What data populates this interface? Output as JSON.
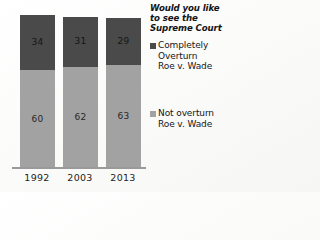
{
  "chart_data": {
    "type": "bar",
    "subtype": "stacked-column",
    "title": "Would you like to see the Supreme Court",
    "title_lines": [
      "Would you like",
      "to see the",
      "Supreme Court"
    ],
    "xlabel": "",
    "ylabel": "",
    "ylim": [
      0,
      100
    ],
    "grid": false,
    "legend_position": "right",
    "categories": [
      "1992",
      "2003",
      "2013"
    ],
    "series": [
      {
        "name": "Completely Overturn Roe v. Wade",
        "name_lines": [
          "Completely",
          "Overturn",
          "Roe v. Wade"
        ],
        "color": "#4a4a4a",
        "values": [
          34,
          31,
          29
        ],
        "stack_position": "top"
      },
      {
        "name": "Not overturn Roe v. Wade",
        "name_lines": [
          "Not overturn",
          "Roe v. Wade"
        ],
        "color": "#a2a2a2",
        "values": [
          60,
          62,
          63
        ],
        "stack_position": "bottom"
      }
    ]
  },
  "colors": {
    "background": "#fdfdfc",
    "axis_line": "#9a9a9a",
    "series_overturn": "#4a4a4a",
    "series_not_overturn": "#a2a2a2",
    "text": "#161616"
  },
  "axis": {
    "categories": [
      "1992",
      "2003",
      "2013"
    ]
  },
  "bars": [
    {
      "category": "1992",
      "top_value": 34,
      "bottom_value": 60
    },
    {
      "category": "2003",
      "top_value": 31,
      "bottom_value": 62
    },
    {
      "category": "2013",
      "top_value": 29,
      "bottom_value": 63
    }
  ]
}
